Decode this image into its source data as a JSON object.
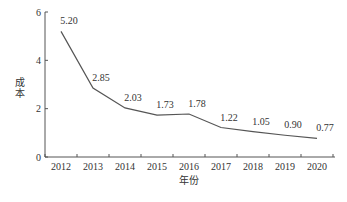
{
  "chart_data": {
    "type": "line",
    "title": "",
    "xlabel": "年份",
    "ylabel": "成本",
    "categories": [
      "2012",
      "2013",
      "2014",
      "2015",
      "2016",
      "2017",
      "2018",
      "2019",
      "2020"
    ],
    "series": [
      {
        "name": "成本",
        "values": [
          5.2,
          2.85,
          2.03,
          1.73,
          1.78,
          1.22,
          1.05,
          0.9,
          0.77
        ]
      }
    ],
    "data_labels": [
      "5.20",
      "2.85",
      "2.03",
      "1.73",
      "1.78",
      "1.22",
      "1.05",
      "0.90",
      "0.77"
    ],
    "yticks": [
      0,
      2,
      4,
      6
    ],
    "ylim": [
      0,
      6
    ],
    "grid": false,
    "legend": false,
    "colors": {
      "line": "#555555",
      "axis": "#555555",
      "text": "#333333"
    }
  }
}
